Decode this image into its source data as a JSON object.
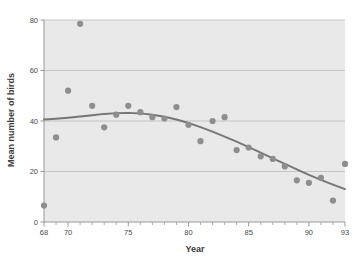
{
  "figure": {
    "background": "#ffffff",
    "plot_background": "#e9e9e9",
    "caption_fragment": ""
  },
  "chart_data": {
    "type": "scatter",
    "title": "",
    "xlabel": "Year",
    "ylabel": "Mean number of birds",
    "xlim": [
      68,
      93
    ],
    "ylim": [
      0,
      80
    ],
    "grid": true,
    "legend": "none",
    "xticks": [
      68,
      70,
      75,
      80,
      85,
      90,
      93
    ],
    "xtick_labels": [
      "68",
      "70",
      "75",
      "80",
      "85",
      "90",
      "93"
    ],
    "xminor_ticks": [
      69,
      71,
      72,
      73,
      74,
      76,
      77,
      78,
      79,
      81,
      82,
      83,
      84,
      86,
      87,
      88,
      89,
      91,
      92
    ],
    "yticks": [
      0,
      20,
      40,
      60,
      80
    ],
    "ytick_labels": [
      "0",
      "20",
      "40",
      "60",
      "80"
    ],
    "marker_color": "#8e8e8e",
    "marker_size": 3.1,
    "line_color": "#767676",
    "line_width": 1.9,
    "points": [
      {
        "x": 68,
        "y": 6.5
      },
      {
        "x": 69,
        "y": 33.5
      },
      {
        "x": 70,
        "y": 52.0
      },
      {
        "x": 71,
        "y": 78.5
      },
      {
        "x": 72,
        "y": 46.0
      },
      {
        "x": 73,
        "y": 37.5
      },
      {
        "x": 74,
        "y": 42.5
      },
      {
        "x": 75,
        "y": 46.0
      },
      {
        "x": 76,
        "y": 43.5
      },
      {
        "x": 77,
        "y": 41.5
      },
      {
        "x": 78,
        "y": 41.0
      },
      {
        "x": 79,
        "y": 45.5
      },
      {
        "x": 80,
        "y": 38.5
      },
      {
        "x": 81,
        "y": 32.0
      },
      {
        "x": 82,
        "y": 40.0
      },
      {
        "x": 83,
        "y": 41.5
      },
      {
        "x": 84,
        "y": 28.5
      },
      {
        "x": 85,
        "y": 29.5
      },
      {
        "x": 86,
        "y": 26.0
      },
      {
        "x": 87,
        "y": 25.0
      },
      {
        "x": 88,
        "y": 22.0
      },
      {
        "x": 89,
        "y": 16.5
      },
      {
        "x": 90,
        "y": 15.5
      },
      {
        "x": 91,
        "y": 17.5
      },
      {
        "x": 92,
        "y": 8.5
      },
      {
        "x": 93,
        "y": 23.0
      }
    ],
    "trend_line": [
      {
        "x": 68,
        "y": 40.6
      },
      {
        "x": 69,
        "y": 40.9
      },
      {
        "x": 70,
        "y": 41.3
      },
      {
        "x": 71,
        "y": 41.8
      },
      {
        "x": 72,
        "y": 42.3
      },
      {
        "x": 73,
        "y": 42.8
      },
      {
        "x": 74,
        "y": 43.1
      },
      {
        "x": 75,
        "y": 43.2
      },
      {
        "x": 76,
        "y": 43.0
      },
      {
        "x": 77,
        "y": 42.5
      },
      {
        "x": 78,
        "y": 41.7
      },
      {
        "x": 79,
        "y": 40.6
      },
      {
        "x": 80,
        "y": 39.2
      },
      {
        "x": 81,
        "y": 37.6
      },
      {
        "x": 82,
        "y": 35.8
      },
      {
        "x": 83,
        "y": 33.8
      },
      {
        "x": 84,
        "y": 31.8
      },
      {
        "x": 85,
        "y": 29.7
      },
      {
        "x": 86,
        "y": 27.5
      },
      {
        "x": 87,
        "y": 25.2
      },
      {
        "x": 88,
        "y": 23.0
      },
      {
        "x": 89,
        "y": 20.8
      },
      {
        "x": 90,
        "y": 18.7
      },
      {
        "x": 91,
        "y": 16.7
      },
      {
        "x": 92,
        "y": 14.8
      },
      {
        "x": 93,
        "y": 13.0
      }
    ]
  }
}
